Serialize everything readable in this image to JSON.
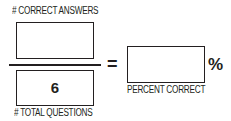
{
  "numerator": {
    "label": "# CORRECT ANSWERS",
    "value": ""
  },
  "denominator": {
    "label": "# TOTAL QUESTIONS",
    "value": "6"
  },
  "equals_sign": "=",
  "result": {
    "label": "PERCENT CORRECT",
    "value": "",
    "unit": "%"
  },
  "colors": {
    "ink": "#231f20",
    "background": "#ffffff"
  }
}
